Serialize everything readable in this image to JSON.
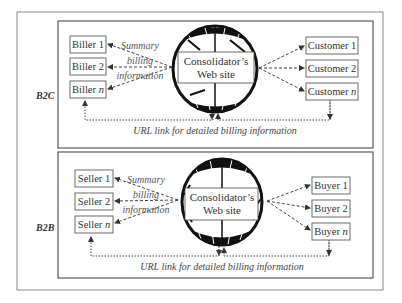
{
  "diagram": {
    "sections": [
      {
        "label": "B2C",
        "hub": {
          "line1": "Consolidator’s",
          "line2": "Web site"
        },
        "left_nodes": [
          "Biller 1",
          "Biller 2",
          "Biller n"
        ],
        "right_nodes": [
          "Customer 1",
          "Customer 2",
          "Customer n"
        ],
        "summary": [
          "Summary",
          "billing",
          "information"
        ],
        "caption": "URL link for detailed billing information"
      },
      {
        "label": "B2B",
        "hub": {
          "line1": "Consolidator’s",
          "line2": "Web site"
        },
        "left_nodes": [
          "Seller 1",
          "Seller 2",
          "Seller n"
        ],
        "right_nodes": [
          "Buyer 1",
          "Buyer 2",
          "Buyer n"
        ],
        "summary": [
          "Summary",
          "billing",
          "information"
        ],
        "caption": "URL link for detailed billing information"
      }
    ],
    "colors": {
      "line": "#444444",
      "globe": "#111111",
      "frame": "#8a8a8a"
    }
  }
}
